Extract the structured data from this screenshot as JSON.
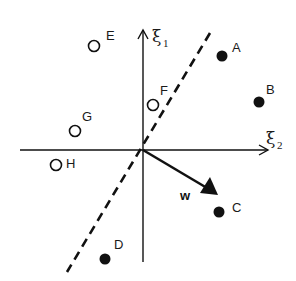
{
  "diagram": {
    "title": "",
    "axes": {
      "vertical": {
        "symbol": "ξ",
        "subscript": "1"
      },
      "horizontal": {
        "symbol": "ξ",
        "subscript": "2"
      }
    },
    "weight_vector": {
      "label": "w"
    },
    "decision_boundary": {
      "style": "dashed"
    },
    "points": [
      {
        "label": "A",
        "class": "filled",
        "x": 222,
        "y": 56
      },
      {
        "label": "B",
        "class": "filled",
        "x": 259,
        "y": 102
      },
      {
        "label": "C",
        "class": "filled",
        "x": 219,
        "y": 212
      },
      {
        "label": "D",
        "class": "filled",
        "x": 105,
        "y": 259
      },
      {
        "label": "E",
        "class": "open",
        "x": 94,
        "y": 46
      },
      {
        "label": "F",
        "class": "open",
        "x": 153,
        "y": 105
      },
      {
        "label": "G",
        "class": "open",
        "x": 75,
        "y": 131
      },
      {
        "label": "H",
        "class": "open",
        "x": 56,
        "y": 165
      }
    ],
    "colors": {
      "ink": "#111111",
      "background": "#ffffff"
    }
  }
}
